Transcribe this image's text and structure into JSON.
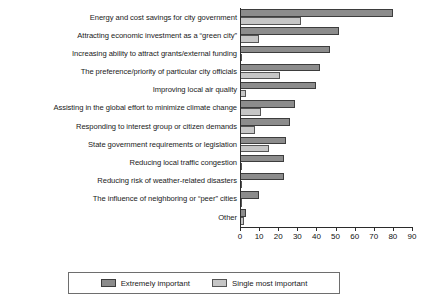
{
  "chart_data": {
    "type": "bar",
    "orientation": "horizontal",
    "title": "",
    "xlabel": "",
    "ylabel": "",
    "xlim": [
      0,
      90
    ],
    "xticks": [
      0,
      10,
      20,
      30,
      40,
      50,
      60,
      70,
      80,
      90
    ],
    "grid": false,
    "legend_position": "bottom",
    "categories": [
      "Energy and cost savings for city government",
      "Attracting economic investment as a “green city”",
      "Increasing ability to attract grants/external funding",
      "The preference/priority of particular city officials",
      "Improving local air quality",
      "Assisting in the global effort to minimize climate change",
      "Responding to interest group or citizen demands",
      "State government requirements or legislation",
      "Reducing local traffic congestion",
      "Reducing risk of weather-related disasters",
      "The influence of neighboring or “peer” cities",
      "Other"
    ],
    "series": [
      {
        "name": "Extremely important",
        "color": "#8c8c8c",
        "values": [
          80,
          52,
          47,
          42,
          40,
          29,
          26,
          24,
          23,
          23,
          10,
          3
        ]
      },
      {
        "name": "Single most important",
        "color": "#c6c6c6",
        "values": [
          32,
          10,
          1,
          21,
          3,
          11,
          8,
          15,
          1,
          1,
          1,
          2
        ]
      }
    ]
  },
  "axis": {
    "tick_labels": [
      "0",
      "10",
      "20",
      "30",
      "40",
      "50",
      "60",
      "70",
      "80",
      "90"
    ]
  },
  "legend": {
    "items": [
      {
        "label": "Extremely important",
        "swatch": "dark"
      },
      {
        "label": "Single most important",
        "swatch": "light"
      }
    ]
  }
}
